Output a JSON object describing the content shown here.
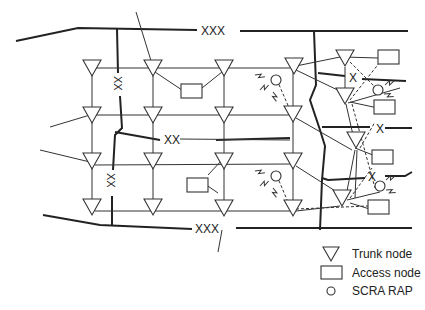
{
  "diagram": {
    "labels": {
      "top_trunk": "XXX",
      "bottom_trunk": "XXX",
      "middle_link": "XX",
      "left_upper_vertical": "XX",
      "left_lower_vertical": "XX",
      "right_x_upper": "X",
      "right_x_middle": "X",
      "right_x_lower": "X"
    },
    "node_counts": {
      "trunk_nodes": 19,
      "access_nodes": 7,
      "scra_raps": 4
    }
  },
  "legend": {
    "items": [
      {
        "symbol": "triangle",
        "label": "Trunk node"
      },
      {
        "symbol": "rectangle",
        "label": "Access node"
      },
      {
        "symbol": "circle",
        "label": "SCRA RAP"
      }
    ]
  },
  "colors": {
    "line": "#222222",
    "background": "#ffffff"
  }
}
